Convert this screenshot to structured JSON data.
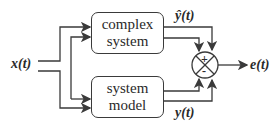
{
  "diagram": {
    "input": {
      "label": "x(t)"
    },
    "blocks": [
      {
        "id": "complex-system",
        "line1": "complex",
        "line2": "system"
      },
      {
        "id": "system-model",
        "line1": "system",
        "line2": "model"
      }
    ],
    "signals": {
      "yhat": "ŷ(t)",
      "y": "y(t)",
      "error": "e(t)"
    },
    "summing_junction": {
      "top_sign": "+",
      "bottom_sign": "-"
    },
    "colors": {
      "stroke": "#3a3a3a",
      "background": "#ffffff"
    }
  }
}
